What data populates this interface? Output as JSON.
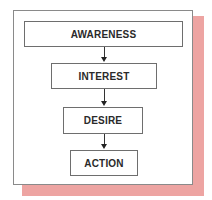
{
  "diagram": {
    "type": "flowchart",
    "title": "",
    "steps": [
      {
        "label": "AWARENESS"
      },
      {
        "label": "INTEREST"
      },
      {
        "label": "DESIRE"
      },
      {
        "label": "ACTION"
      }
    ],
    "connectors": [
      {
        "from": "AWARENESS",
        "to": "INTEREST"
      },
      {
        "from": "INTEREST",
        "to": "DESIRE"
      },
      {
        "from": "DESIRE",
        "to": "ACTION"
      }
    ],
    "colors": {
      "shadow": "#eda4a2",
      "border": "#6e6e6e",
      "text": "#2a2a2a"
    }
  }
}
